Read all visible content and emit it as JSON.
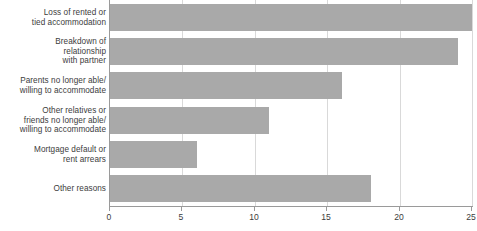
{
  "chart_data": {
    "type": "bar",
    "orientation": "horizontal",
    "title": "",
    "xlabel": "",
    "ylabel": "",
    "xlim": [
      0,
      25
    ],
    "grid": true,
    "legend": false,
    "bar_color": "#a9a9a9",
    "axis_color": "#9a9a9a",
    "gridline_color": "#d9d9d9",
    "text_color": "#3c3c3c",
    "categories": [
      "Loss of rented or\ntied accommodation",
      "Breakdown of\nrelationship\nwith partner",
      "Parents no longer able/\nwilling to accommodate",
      "Other relatives or\nfriends no longer able/\nwilling to accommodate",
      "Mortgage default or\nrent arrears",
      "Other reasons"
    ],
    "values": [
      25,
      24,
      16,
      11,
      6,
      18
    ],
    "xticks": [
      0,
      5,
      10,
      15,
      20,
      25
    ],
    "xtick_labels": [
      "0",
      "5",
      "10",
      "15",
      "20",
      "25"
    ]
  }
}
